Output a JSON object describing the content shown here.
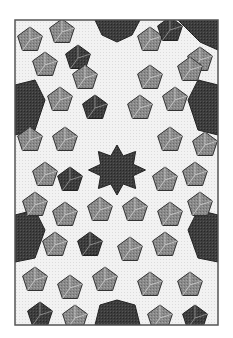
{
  "image": {
    "width": 233,
    "height": 338,
    "description": "Islamic geometric tiling with ten-pointed dark stars, grey pentagonal tiles, white five-pointed stars",
    "frame": {
      "x": 15,
      "y": 20,
      "w": 203,
      "h": 305
    },
    "colors": {
      "background": "#ffffff",
      "frame": "#555555",
      "dark": "#3a3a3a",
      "mid": "#7a7a7a",
      "light_grey": "#9c9c9c",
      "white_star": "#f1f1f1",
      "line": "#333333"
    },
    "center_star": {
      "cx": 117,
      "cy": 170,
      "r_outer": 30,
      "r_inner": 20,
      "points": 10
    }
  }
}
